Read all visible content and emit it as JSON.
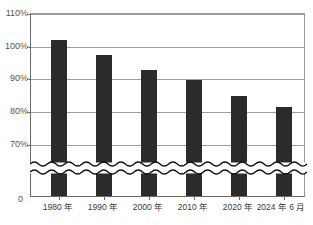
{
  "chart_data": {
    "type": "bar",
    "title": "",
    "subtitle": "",
    "xlabel": "",
    "ylabel": "",
    "categories": [
      "1980 年",
      "1990 年",
      "2000 年",
      "2010 年",
      "2020 年",
      "2024 年 6 月"
    ],
    "values": [
      102,
      97.5,
      93,
      89.8,
      85,
      81.5
    ],
    "series": [
      {
        "name": "",
        "values": [
          102,
          97.5,
          93,
          89.8,
          85,
          81.5
        ]
      }
    ],
    "ylim": [
      70,
      110
    ],
    "ytick_labels": [
      "110%",
      "100%",
      "90%",
      "80%",
      "70%",
      "0"
    ],
    "ytick_values": [
      110,
      100,
      90,
      80,
      70,
      0
    ],
    "grid": true,
    "legend": null,
    "legend_position": "none",
    "axis_break": {
      "present": true,
      "style": "wavy-double-line",
      "between": [
        0,
        70
      ]
    },
    "bar_color": "#2b2b2b",
    "gridline_color": "#9d9d9d",
    "axis_color": "#6b6b6b",
    "background_color": "#ffffff",
    "annotations": []
  }
}
